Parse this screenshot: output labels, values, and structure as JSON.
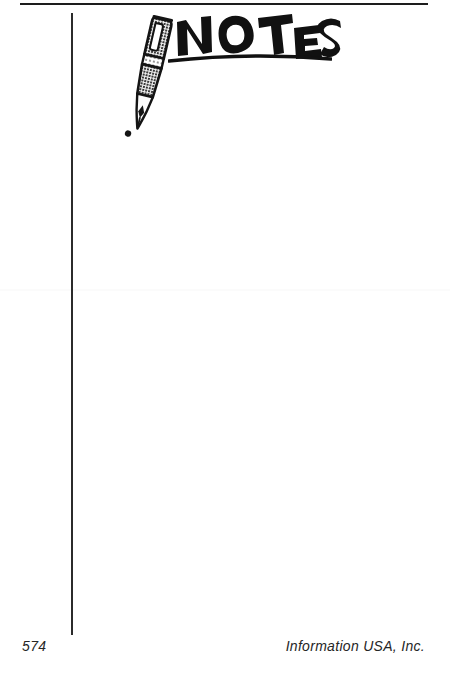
{
  "page": {
    "background_color": "#ffffff",
    "ink_color": "#1d1d1d",
    "width": 450,
    "height": 683
  },
  "heading": {
    "text": "NOTES",
    "style": "hand-lettered-marker",
    "underline": "hand-drawn-arc"
  },
  "illustration": {
    "name": "fountain-pen",
    "description": "tilted fountain pen with clip, halftone barrel, grip band and nib with ink drop"
  },
  "rules": {
    "top_rule": "horizontal-rule",
    "vertical_rule": "vertical-margin-rule"
  },
  "content": {
    "body_text": ""
  },
  "footer": {
    "page_number": "574",
    "publisher": "Information USA, Inc."
  }
}
